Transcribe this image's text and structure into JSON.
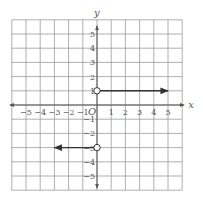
{
  "chart_data": {
    "type": "line",
    "title": "",
    "xlabel": "x",
    "ylabel": "y",
    "origin_label": "O",
    "xlim": [
      -6,
      6
    ],
    "ylim": [
      -6,
      6
    ],
    "grid": true,
    "x_ticks": [
      "-5",
      "-4",
      "-3",
      "-2",
      "-1",
      "1",
      "2",
      "3",
      "4",
      "5"
    ],
    "y_ticks": [
      "5",
      "4",
      "3",
      "2",
      "1",
      "-1",
      "-2",
      "-3",
      "-4",
      "-5"
    ],
    "series": [
      {
        "name": "ray-right",
        "description": "Horizontal ray y = 1 for x > 0",
        "y": 1,
        "x_start": 0,
        "x_end": 5,
        "start_point": "open",
        "arrow": "right"
      },
      {
        "name": "ray-left",
        "description": "Horizontal ray y = -3 for x < 0",
        "y": -3,
        "x_start": 0,
        "x_end": -3,
        "start_point": "open",
        "arrow": "left"
      }
    ],
    "points": [
      {
        "x": 0,
        "y": 1,
        "style": "open"
      },
      {
        "x": 0,
        "y": -3,
        "style": "open"
      }
    ]
  },
  "labels": {
    "x_axis": "x",
    "y_axis": "y",
    "origin": "O"
  }
}
